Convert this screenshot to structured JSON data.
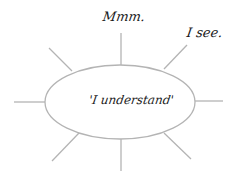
{
  "diagram": {
    "type": "spider-diagram",
    "center": {
      "label": "'I understand'"
    },
    "spokes": [
      {
        "position": "top",
        "label": "Mmm."
      },
      {
        "position": "top-right",
        "label": "I see."
      },
      {
        "position": "right",
        "label": ""
      },
      {
        "position": "bottom-right",
        "label": ""
      },
      {
        "position": "bottom",
        "label": ""
      },
      {
        "position": "bottom-left",
        "label": ""
      },
      {
        "position": "left",
        "label": ""
      },
      {
        "position": "top-left",
        "label": ""
      }
    ],
    "colors": {
      "line": "#b4b4b4",
      "text": "#1a1a1a",
      "background": "#ffffff"
    }
  }
}
